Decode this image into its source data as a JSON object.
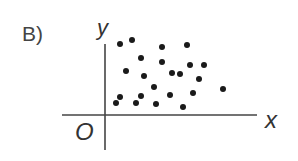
{
  "option_label": "B)",
  "chart_data": {
    "type": "scatter",
    "title": "",
    "xlabel": "x",
    "ylabel": "y",
    "origin_label": "O",
    "grid": false,
    "legend": null,
    "axis_pixels": {
      "origin": [
        105,
        115
      ],
      "x_end": 257,
      "y_top": 44,
      "y_bottom": 150,
      "x_start": 62
    },
    "points_px": [
      [
        120,
        44
      ],
      [
        132,
        40
      ],
      [
        162,
        47
      ],
      [
        187,
        45
      ],
      [
        141,
        58
      ],
      [
        162,
        62
      ],
      [
        190,
        65
      ],
      [
        204,
        65
      ],
      [
        126,
        71
      ],
      [
        144,
        76
      ],
      [
        172,
        73
      ],
      [
        180,
        74
      ],
      [
        199,
        79
      ],
      [
        154,
        87
      ],
      [
        141,
        96
      ],
      [
        170,
        95
      ],
      [
        193,
        93
      ],
      [
        223,
        89
      ],
      [
        120,
        97
      ],
      [
        116,
        103
      ],
      [
        136,
        103
      ],
      [
        156,
        104
      ],
      [
        183,
        107
      ]
    ],
    "points": [
      {
        "x": 15,
        "y": 71
      },
      {
        "x": 27,
        "y": 75
      },
      {
        "x": 57,
        "y": 68
      },
      {
        "x": 82,
        "y": 70
      },
      {
        "x": 36,
        "y": 57
      },
      {
        "x": 57,
        "y": 53
      },
      {
        "x": 85,
        "y": 50
      },
      {
        "x": 99,
        "y": 50
      },
      {
        "x": 21,
        "y": 44
      },
      {
        "x": 39,
        "y": 39
      },
      {
        "x": 67,
        "y": 42
      },
      {
        "x": 75,
        "y": 41
      },
      {
        "x": 94,
        "y": 36
      },
      {
        "x": 49,
        "y": 28
      },
      {
        "x": 36,
        "y": 19
      },
      {
        "x": 65,
        "y": 20
      },
      {
        "x": 88,
        "y": 22
      },
      {
        "x": 118,
        "y": 26
      },
      {
        "x": 15,
        "y": 18
      },
      {
        "x": 11,
        "y": 12
      },
      {
        "x": 31,
        "y": 12
      },
      {
        "x": 51,
        "y": 11
      },
      {
        "x": 78,
        "y": 8
      }
    ],
    "note": "No correlation scatter; no tick labels shown"
  }
}
